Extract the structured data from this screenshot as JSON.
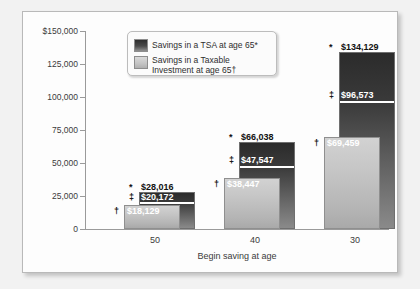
{
  "chart": {
    "type": "bar",
    "title": "",
    "xlabel": "Begin saving at age",
    "ylabel": "",
    "ylim": [
      0,
      150000
    ],
    "yticks": [
      "$150,000",
      "125,000",
      "100,000",
      "75,000",
      "50,000",
      "25,000",
      "0"
    ],
    "ytick_values": [
      150000,
      125000,
      100000,
      75000,
      50000,
      25000,
      0
    ],
    "grid": false,
    "legend_position": "top-left",
    "categories": [
      "50",
      "40",
      "30"
    ],
    "series": [
      {
        "name": "Savings in a TSA at age 65*",
        "marker": "*",
        "color": "#2d2d2d",
        "values": [
          28016,
          66038,
          134129
        ],
        "labels": [
          "$28,016",
          "$66,038",
          "$134,129"
        ]
      },
      {
        "name": "Savings in a TSA after taxes",
        "marker": "‡",
        "color": "#4a4a4a",
        "values": [
          20172,
          47547,
          96573
        ],
        "labels": [
          "$20,172",
          "$47,547",
          "$96,573"
        ]
      },
      {
        "name": "Savings in a Taxable Investment at age 65†",
        "marker": "†",
        "color": "#c4c4c4",
        "values": [
          18129,
          38447,
          69459
        ],
        "labels": [
          "$18,129",
          "$38,447",
          "$69,459"
        ]
      }
    ]
  },
  "legend": {
    "items": [
      {
        "swatch": "dark",
        "line1": "Savings in a TSA at age 65*",
        "line2": ""
      },
      {
        "swatch": "light",
        "line1": "Savings in a Taxable",
        "line2": "Investment at age 65†"
      }
    ]
  }
}
